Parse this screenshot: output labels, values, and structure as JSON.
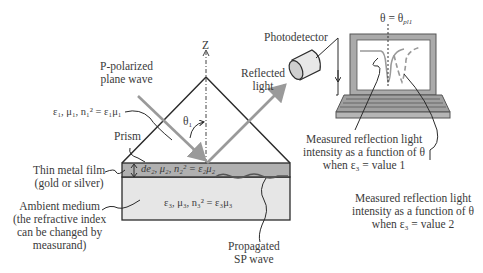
{
  "figure": {
    "colors": {
      "line": "#2b2b2b",
      "ray": "#9a9a9a",
      "metal_film": "#b0b0b0",
      "ambient": "#e6e6e6",
      "laptop_body": "#aaaaaa",
      "laptop_frame": "#999999",
      "screen": "#ffffff"
    },
    "axis": {
      "label": "Z"
    },
    "labels": {
      "incident_wave": [
        "P-polarized",
        "plane wave"
      ],
      "reflected": [
        "Reflected",
        "light"
      ],
      "photodetector": "Photodetector",
      "theta_resonance": {
        "base": "θ = θ",
        "sub": "pl1"
      },
      "theta1": {
        "base": "θ",
        "sub": "1"
      },
      "prism": "Prism",
      "thin_film": [
        "Thin metal film",
        "(gold or silver)"
      ],
      "ambient": [
        "Ambient medium",
        "(the refractive index",
        "can be changed by",
        "measurand)"
      ],
      "sp_wave": [
        "Propagated",
        "SP wave"
      ],
      "curve1": [
        "Measured reflection light",
        "intensity as a function of θ",
        "when ε₃ = value 1"
      ],
      "curve2": [
        "Measured reflection light",
        "intensity as a function of θ",
        "when ε₃ = value 2"
      ]
    },
    "equations": {
      "prism_medium": "ε₁, μ₁, n₁² = ε₁μ₁",
      "metal_film": "de₂, μ₂, n₂² = ε₂μ₂",
      "ambient_medium": "ε₃, μ₃, n₃² = ε₃μ₃"
    }
  }
}
